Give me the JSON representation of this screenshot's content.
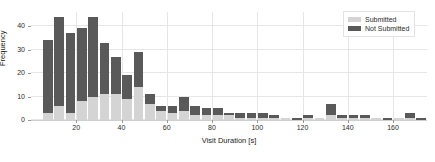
{
  "chart_data": {
    "type": "bar",
    "title": "",
    "subtitle": "",
    "xlabel": "Visit Duration [s]",
    "ylabel": "Frequency",
    "xlim": [
      0,
      175
    ],
    "ylim": [
      0,
      46
    ],
    "xticks": [
      20,
      40,
      60,
      80,
      100,
      120,
      140,
      160
    ],
    "yticks": [
      0,
      10,
      20,
      30,
      40
    ],
    "grid": true,
    "stacked": true,
    "bin_width": 5,
    "legend": {
      "position": "upper-right",
      "entries": [
        {
          "name": "Submitted",
          "color": "#d4d4d4"
        },
        {
          "name": "Not Submitted",
          "color": "#595959"
        }
      ]
    },
    "x": [
      7.5,
      12.5,
      17.5,
      22.5,
      27.5,
      32.5,
      37.5,
      42.5,
      47.5,
      52.5,
      57.5,
      62.5,
      67.5,
      72.5,
      77.5,
      82.5,
      87.5,
      92.5,
      97.5,
      102.5,
      107.5,
      112.5,
      117.5,
      122.5,
      127.5,
      132.5,
      137.5,
      142.5,
      147.5,
      152.5,
      157.5,
      162.5,
      167.5,
      172.5
    ],
    "categories": [
      "5-10",
      "10-15",
      "15-20",
      "20-25",
      "25-30",
      "30-35",
      "35-40",
      "40-45",
      "45-50",
      "50-55",
      "55-60",
      "60-65",
      "65-70",
      "70-75",
      "75-80",
      "80-85",
      "85-90",
      "90-95",
      "95-100",
      "100-105",
      "105-110",
      "110-115",
      "115-120",
      "120-125",
      "125-130",
      "130-135",
      "135-140",
      "140-145",
      "145-150",
      "150-155",
      "155-160",
      "160-165",
      "165-170",
      "170-175"
    ],
    "series": [
      {
        "name": "Submitted",
        "color": "#d4d4d4",
        "values": [
          3,
          6,
          3,
          8,
          10,
          11,
          11,
          9,
          14,
          7,
          4,
          3,
          4,
          2,
          2,
          2,
          2,
          1,
          1,
          1,
          1,
          1,
          0,
          1,
          1,
          2,
          1,
          1,
          1,
          1,
          0,
          1,
          1,
          0
        ]
      },
      {
        "name": "Not Submitted",
        "color": "#595959",
        "values": [
          31,
          38,
          34,
          31,
          34,
          22,
          16,
          10,
          15,
          4,
          2,
          3,
          6,
          4,
          3,
          3,
          1,
          2,
          2,
          2,
          1,
          0,
          1,
          1,
          0,
          5,
          1,
          1,
          1,
          0,
          1,
          0,
          2,
          1
        ]
      }
    ],
    "totals": [
      34,
      44,
      37,
      39,
      44,
      33,
      27,
      19,
      29,
      11,
      6,
      6,
      10,
      6,
      5,
      5,
      3,
      3,
      3,
      3,
      2,
      1,
      1,
      2,
      1,
      7,
      2,
      2,
      2,
      1,
      1,
      1,
      3,
      1
    ]
  }
}
